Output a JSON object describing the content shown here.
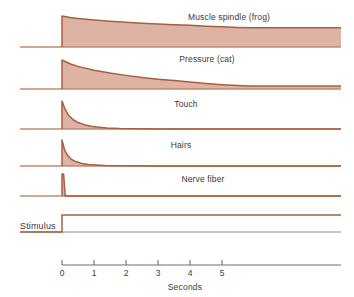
{
  "chart_data": {
    "type": "area",
    "title": "",
    "xlabel": "Seconds",
    "ylabel": "",
    "xlim": [
      -1.3,
      5.9
    ],
    "ylim": [
      0,
      1
    ],
    "grid": false,
    "legend_position": "inline-above-each-trace",
    "x_ticks": [
      0,
      1,
      2,
      3,
      4,
      5
    ],
    "x_tick_labels": [
      "0",
      "1",
      "2",
      "3",
      "4",
      "5"
    ],
    "stimulus_onset_seconds": 0,
    "series": [
      {
        "name": "Muscle spindle (frog)",
        "label": "Muscle spindle (frog)",
        "adaptation": "slow",
        "peak_amplitude": 1.0,
        "amplitude_at_end": 0.62,
        "x": [
          0,
          0.25,
          0.5,
          1,
          1.5,
          2,
          2.5,
          3,
          3.5,
          4,
          4.5,
          5,
          5.5,
          5.9
        ],
        "values": [
          1.0,
          0.95,
          0.92,
          0.87,
          0.83,
          0.8,
          0.77,
          0.74,
          0.72,
          0.7,
          0.67,
          0.65,
          0.63,
          0.62
        ]
      },
      {
        "name": "Pressure (cat)",
        "label": "Pressure (cat)",
        "adaptation": "slow-moderate",
        "peak_amplitude": 1.0,
        "amplitude_at_end": 0.1,
        "x": [
          0,
          0.25,
          0.5,
          1,
          1.5,
          2,
          2.5,
          3,
          3.5,
          4,
          4.5,
          5,
          5.5,
          5.9
        ],
        "values": [
          1.0,
          0.87,
          0.78,
          0.65,
          0.55,
          0.47,
          0.4,
          0.34,
          0.29,
          0.24,
          0.19,
          0.15,
          0.12,
          0.1
        ]
      },
      {
        "name": "Touch",
        "label": "Touch",
        "adaptation": "rapid",
        "peak_amplitude": 1.0,
        "amplitude_at_end": 0.0,
        "x": [
          0,
          0.1,
          0.2,
          0.35,
          0.5,
          0.7,
          0.9,
          1.1,
          1.4,
          1.8,
          2.3,
          3.0
        ],
        "values": [
          1.0,
          0.7,
          0.5,
          0.33,
          0.23,
          0.15,
          0.1,
          0.07,
          0.04,
          0.02,
          0.01,
          0.0
        ]
      },
      {
        "name": "Hairs",
        "label": "Hairs",
        "adaptation": "rapid",
        "peak_amplitude": 1.0,
        "amplitude_at_end": 0.0,
        "x": [
          0,
          0.08,
          0.18,
          0.3,
          0.45,
          0.62,
          0.82,
          1.05,
          1.35,
          1.7,
          2.2,
          2.8
        ],
        "values": [
          1.0,
          0.62,
          0.4,
          0.25,
          0.16,
          0.1,
          0.06,
          0.04,
          0.02,
          0.01,
          0.005,
          0.0
        ]
      },
      {
        "name": "Nerve fiber",
        "label": "Nerve fiber",
        "adaptation": "very-rapid",
        "peak_amplitude": 1.0,
        "amplitude_at_end": 0.0,
        "x": [
          0,
          0.05,
          0.1
        ],
        "values": [
          1.0,
          1.0,
          0.0
        ]
      }
    ],
    "stimulus": {
      "label": "Stimulus",
      "onset": 0,
      "shape": "step",
      "held_through_end": true
    },
    "colors": {
      "curve_outline": "#a5603f",
      "curve_fill": "#ddb3a3",
      "baseline": "#c08a6d",
      "axis": "#6e6e6e",
      "text": "#3a3a3a",
      "background": "#ffffff"
    }
  }
}
